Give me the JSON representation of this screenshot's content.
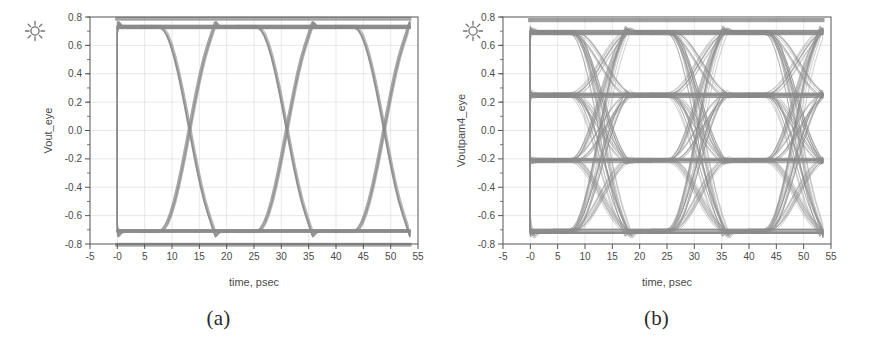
{
  "figure": {
    "panels": [
      {
        "id": "a",
        "caption": "(a)",
        "marker_icon": "sun-marker-icon",
        "chart_data": {
          "type": "line",
          "title": "",
          "subtitle": "",
          "modulation": "NRZ",
          "xlabel": "time, psec",
          "ylabel": "Vout_eye",
          "xlim": [
            -5,
            55
          ],
          "ylim": [
            -0.8,
            0.8
          ],
          "xticks": [
            -5,
            0,
            5,
            10,
            15,
            20,
            25,
            30,
            35,
            40,
            45,
            50,
            55
          ],
          "xtick_labels": [
            "-5",
            "-0",
            "5",
            "10",
            "15",
            "20",
            "25",
            "30",
            "35",
            "40",
            "45",
            "50",
            "55"
          ],
          "yticks": [
            0.8,
            0.6,
            0.4,
            0.2,
            0.0,
            -0.2,
            -0.4,
            -0.6,
            -0.8
          ],
          "ytick_labels": [
            "0.8",
            "0.6",
            "0.4",
            "0.2",
            "0.0",
            "-0.2",
            "-0.4",
            "-0.6",
            "-0.8"
          ],
          "grid": true,
          "legend": "none",
          "data_x_start": 0,
          "data_x_end": 53.5,
          "unit_interval_psec": 17.8,
          "eye_crossing_times": [
            13.2,
            31.0,
            48.8
          ],
          "levels": [
            0.73,
            -0.71
          ],
          "level_labels": [
            "logic 1",
            "logic 0"
          ],
          "rail_top": 0.79,
          "rail_bottom": -0.79,
          "eye_count": 3,
          "trace_color": "#8c8c8c",
          "rail_color": "#7a7a7a",
          "axis_color": "#555555",
          "grid_color": "#d8d8d8"
        }
      },
      {
        "id": "b",
        "caption": "(b)",
        "marker_icon": "sun-marker-icon",
        "chart_data": {
          "type": "line",
          "title": "",
          "subtitle": "",
          "modulation": "PAM4",
          "xlabel": "time, psec",
          "ylabel": "Voutpam4_eye",
          "xlim": [
            -5,
            55
          ],
          "ylim": [
            -0.8,
            0.8
          ],
          "xticks": [
            -5,
            0,
            5,
            10,
            15,
            20,
            25,
            30,
            35,
            40,
            45,
            50,
            55
          ],
          "xtick_labels": [
            "-5",
            "-0",
            "5",
            "10",
            "15",
            "20",
            "25",
            "30",
            "35",
            "40",
            "45",
            "50",
            "55"
          ],
          "yticks": [
            0.8,
            0.6,
            0.4,
            0.2,
            0.0,
            -0.2,
            -0.4,
            -0.6,
            -0.8
          ],
          "ytick_labels": [
            "0.8",
            "0.6",
            "0.4",
            "0.2",
            "0.0",
            "-0.2",
            "-0.4",
            "-0.6",
            "-0.8"
          ],
          "grid": true,
          "legend": "none",
          "data_x_start": 0,
          "data_x_end": 53.5,
          "unit_interval_psec": 17.8,
          "eye_crossing_times": [
            13.2,
            31.0,
            48.8
          ],
          "levels": [
            0.69,
            0.25,
            -0.21,
            -0.71
          ],
          "level_labels": [
            "11",
            "10",
            "01",
            "00"
          ],
          "rail_top": 0.78,
          "eye_count": 3,
          "eye_rows": 3,
          "trace_color": "#8c8c8c",
          "rail_color": "#7a7a7a",
          "axis_color": "#555555",
          "grid_color": "#d8d8d8"
        }
      }
    ]
  }
}
